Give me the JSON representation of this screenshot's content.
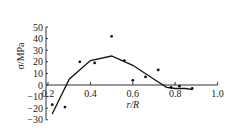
{
  "chart_data": {
    "type": "scatter",
    "title": "",
    "xlabel": "r/R",
    "ylabel": "σ/MPa",
    "xlim": [
      0.2,
      1.0
    ],
    "ylim": [
      -30,
      50
    ],
    "xticks": [
      "0.2",
      "0.4",
      "0.6",
      "0.8",
      "1.0"
    ],
    "yticks": [
      "50",
      "40",
      "30",
      "20",
      "10",
      "0",
      "-10",
      "-20",
      "-30"
    ],
    "series": [
      {
        "name": "measured",
        "type": "scatter",
        "x": [
          0.22,
          0.28,
          0.35,
          0.42,
          0.5,
          0.56,
          0.6,
          0.66,
          0.72,
          0.78,
          0.82,
          0.88
        ],
        "y": [
          -17,
          -19,
          20,
          19,
          42,
          21,
          4,
          7,
          13,
          -2,
          -1,
          -3
        ]
      },
      {
        "name": "fit",
        "type": "line",
        "x": [
          0.22,
          0.3,
          0.4,
          0.5,
          0.6,
          0.7,
          0.76,
          0.8,
          0.85,
          0.88
        ],
        "y": [
          -25,
          5,
          21,
          25,
          17,
          5,
          -2,
          -3,
          -3,
          -4
        ]
      }
    ]
  }
}
